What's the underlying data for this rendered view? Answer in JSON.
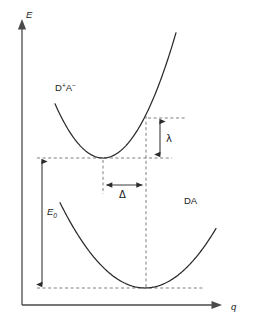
{
  "figure": {
    "type": "scientific-diagram",
    "background_color": "#ffffff",
    "curve_color": "#2b2b2b",
    "axis_color": "#4a4a4a",
    "guide_color": "#6f6f6f",
    "label_color": "#1a1a1a"
  },
  "axes": {
    "y": {
      "name": "energy-axis",
      "label": "E",
      "italic": true,
      "label_x": 26,
      "label_y": 18,
      "x": 22,
      "y_top": 22,
      "y_bottom": 305,
      "arrow": "up"
    },
    "x": {
      "name": "reaction-coordinate-axis",
      "label": "q",
      "italic": true,
      "label_x": 231,
      "label_y": 310,
      "y": 305,
      "x_left": 22,
      "x_right": 222,
      "arrow": "right"
    }
  },
  "curves": [
    {
      "name": "donor-acceptor-charge-separated-curve",
      "label": "D⁺A⁻",
      "label_parts": {
        "base1": "D",
        "sup1": "+",
        "base2": "A",
        "sup2": "−"
      },
      "label_x": 55,
      "label_y": 91,
      "vertex_x": 103,
      "vertex_y": 158,
      "curvature": 0.0235,
      "x_start": 55,
      "x_end": 176,
      "state": "charge-separated"
    },
    {
      "name": "donor-acceptor-neutral-curve",
      "label": "DA",
      "label_x": 184,
      "label_y": 204,
      "vertex_x": 145,
      "vertex_y": 288,
      "curvature": 0.0118,
      "x_start": 60,
      "x_end": 216,
      "state": "neutral-ground"
    }
  ],
  "guides": [
    {
      "name": "guide-upper-vertex-level",
      "x1": 37,
      "y1": 158,
      "x2": 172,
      "y2": 158
    },
    {
      "name": "guide-lower-vertex-level",
      "x1": 37,
      "y1": 288,
      "x2": 205,
      "y2": 288
    },
    {
      "name": "guide-reorganization-top-level",
      "x1": 148,
      "y1": 118,
      "x2": 186,
      "y2": 118
    },
    {
      "name": "guide-upper-vertex-vertical",
      "x1": 103,
      "y1": 158,
      "x2": 103,
      "y2": 194
    },
    {
      "name": "guide-lower-vertex-vertical",
      "x1": 146,
      "y1": 118,
      "x2": 146,
      "y2": 288
    }
  ],
  "measures": [
    {
      "name": "reorganization-energy-measure",
      "symbol": "λ",
      "orientation": "vertical",
      "x": 160,
      "y_from": 118,
      "y_to": 158,
      "label_x": 166,
      "label_y": 142,
      "description": "reorganization energy lambda"
    },
    {
      "name": "coordinate-displacement-measure",
      "symbol": "Δ",
      "orientation": "horizontal",
      "y": 185,
      "x_from": 103,
      "x_to": 146,
      "label_x": 119,
      "label_y": 197,
      "description": "displacement along reaction coordinate Delta"
    },
    {
      "name": "driving-energy-measure",
      "symbol": "E",
      "subscript": "0",
      "italic": true,
      "orientation": "vertical",
      "x": 42,
      "y_from": 158,
      "y_to": 288,
      "label_x": 47,
      "label_y": 215,
      "description": "energy gap E zero between the two minima"
    }
  ]
}
